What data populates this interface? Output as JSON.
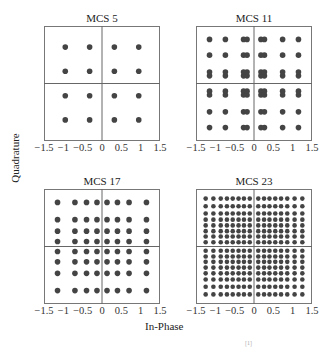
{
  "chart_data": {
    "type": "scatter",
    "xlabel": "In-Phase",
    "ylabel": "Quadrature",
    "caption_fragment": "[1]",
    "panels": [
      {
        "title": "MCS 5",
        "xlim": [
          -1.5,
          1.5
        ],
        "ylim": [
          -1.5,
          1.5
        ],
        "xticks": [
          "-1.5",
          "-1",
          "-0.5",
          "0",
          "0.5",
          "1",
          "1.5"
        ],
        "yticks": [
          "1.5",
          "1",
          "0.5",
          "0",
          "-0.5",
          "-1",
          "-1.5"
        ],
        "grid_levels_x": [
          -0.95,
          -0.32,
          0.32,
          0.95
        ],
        "grid_levels_y": [
          -0.95,
          -0.32,
          0.32,
          0.95
        ],
        "points_count": 16
      },
      {
        "title": "MCS 11",
        "xlim": [
          -1.5,
          1.5
        ],
        "ylim": [
          -1.5,
          1.5
        ],
        "xticks": [
          "-1.5",
          "-1",
          "-0.5",
          "0",
          "0.5",
          "1",
          "1.5"
        ],
        "yticks": [
          "1.5",
          "1",
          "0.5",
          "0",
          "-0.5",
          "-1",
          "-1.5"
        ],
        "grid_levels_x": [
          -1.15,
          -0.74,
          -0.27,
          -0.18,
          0.18,
          0.27,
          0.74,
          1.15
        ],
        "grid_levels_y": [
          -1.15,
          -0.74,
          -0.3,
          -0.2,
          0.2,
          0.3,
          0.74,
          1.15
        ],
        "points_count": 64
      },
      {
        "title": "MCS 17",
        "xlim": [
          -1.5,
          1.5
        ],
        "ylim": [
          -1.5,
          1.5
        ],
        "xticks": [
          "-1.5",
          "-1",
          "-0.5",
          "0",
          "0.5",
          "1",
          "1.5"
        ],
        "yticks": [
          "1.5",
          "1",
          "0.5",
          "0",
          "-0.5",
          "-1",
          "-1.5"
        ],
        "grid_levels_x": [
          -1.15,
          -0.7,
          -0.4,
          -0.13,
          0.13,
          0.4,
          0.7,
          1.15
        ],
        "grid_levels_y": [
          -1.15,
          -0.7,
          -0.4,
          -0.13,
          0.13,
          0.4,
          0.7,
          1.15
        ],
        "points_count": 64
      },
      {
        "title": "MCS 23",
        "xlim": [
          -1.5,
          1.5
        ],
        "ylim": [
          -1.5,
          1.5
        ],
        "xticks": [
          "-1.5",
          "-1",
          "-0.5",
          "0",
          "0.5",
          "1",
          "1.5"
        ],
        "yticks": [
          "1.5",
          "1",
          "0.5",
          "0",
          "-0.5",
          "-1",
          "-1.5"
        ],
        "grid_levels_x": [
          -1.25,
          -1.05,
          -0.86,
          -0.7,
          -0.55,
          -0.4,
          -0.26,
          -0.11,
          0.11,
          0.26,
          0.4,
          0.55,
          0.7,
          0.86,
          1.05,
          1.25
        ],
        "grid_levels_y": [
          -1.25,
          -1.05,
          -0.86,
          -0.7,
          -0.55,
          -0.4,
          -0.26,
          -0.11,
          0.11,
          0.26,
          0.4,
          0.55,
          0.7,
          0.86,
          1.05,
          1.25
        ],
        "points_count": 256
      }
    ],
    "style": {
      "point_color": "#444444",
      "axis_color": "#666666",
      "frame_color": "#777777"
    }
  }
}
